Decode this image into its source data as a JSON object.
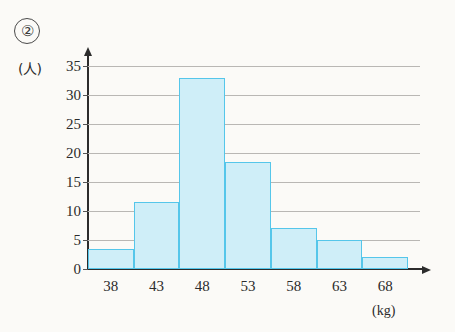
{
  "problem_number": "②",
  "axis": {
    "y_unit_label": "(人)",
    "x_unit_label": "(kg)"
  },
  "chart_data": {
    "type": "bar",
    "title": "",
    "xlabel": "(kg)",
    "ylabel": "(人)",
    "categories": [
      "38",
      "43",
      "48",
      "53",
      "58",
      "63",
      "68"
    ],
    "values": [
      3.5,
      11.5,
      33,
      18.5,
      7,
      5,
      2
    ],
    "ylim": [
      0,
      35
    ],
    "y_ticks": [
      "0",
      "5",
      "10",
      "15",
      "20",
      "25",
      "30",
      "35"
    ],
    "y_tick_values": [
      0,
      5,
      10,
      15,
      20,
      25,
      30,
      35
    ],
    "grid": true,
    "legend": "none",
    "bin_width": 5,
    "bar_fill_color": "#cfeef8",
    "bar_border_color": "#55c6ea",
    "gridline_color": "#b9b7b4",
    "axis_color": "#2c2c2c"
  }
}
